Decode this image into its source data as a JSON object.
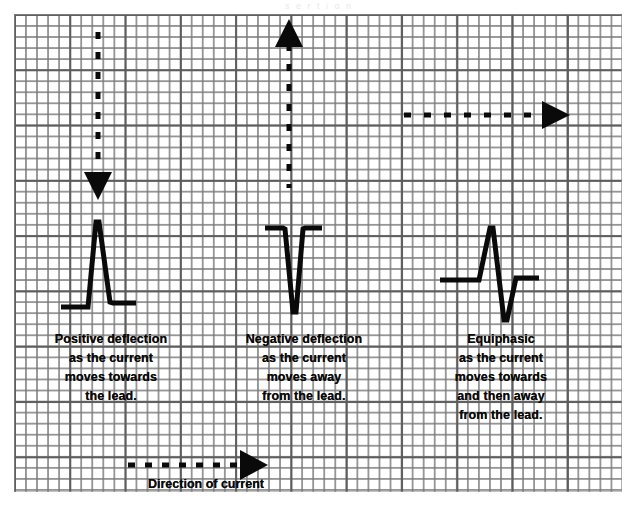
{
  "figure": {
    "title_faint": "s  e   r   t   i  o  n",
    "background_color": "#ffffff",
    "grid_color": "#787878",
    "grid_major_color": "#5a5a5a",
    "ink_color": "#0a0a0a"
  },
  "panels": [
    {
      "id": "positive",
      "arrow": {
        "name": "down-arrow",
        "direction": "down",
        "style": "dashed",
        "dash_count": 8,
        "description": "current moving toward the lead"
      },
      "waveform": {
        "name": "positive-deflection-waveform",
        "type": "upward-spike",
        "baseline_y": 307,
        "peak_y": 222
      },
      "caption": {
        "lines": [
          "Positive deflection",
          "as the current",
          "moves towards",
          "the lead."
        ]
      }
    },
    {
      "id": "negative",
      "arrow": {
        "name": "up-arrow",
        "direction": "up",
        "style": "dashed",
        "dash_count": 8,
        "description": "current moving away from the lead"
      },
      "waveform": {
        "name": "negative-deflection-waveform",
        "type": "downward-spike",
        "baseline_y": 228,
        "trough_y": 312
      },
      "caption": {
        "lines": [
          "Negative deflection",
          "as the current",
          "moves away",
          "from the lead."
        ]
      }
    },
    {
      "id": "equiphasic",
      "arrow": {
        "name": "right-arrow",
        "direction": "right",
        "style": "dashed",
        "dash_count": 7,
        "description": "current moving perpendicular to the lead"
      },
      "waveform": {
        "name": "equiphasic-waveform",
        "type": "biphasic-spike",
        "baseline_y": 280,
        "peak_y": 228,
        "trough_y": 320
      },
      "caption": {
        "lines": [
          "Equiphasic",
          "as the current",
          "moves towards",
          "and then away",
          "from the lead."
        ]
      }
    }
  ],
  "legend": {
    "arrow": {
      "name": "direction-of-current-arrow",
      "direction": "right",
      "style": "dashed",
      "dash_count": 7
    },
    "label": "Direction of current"
  }
}
